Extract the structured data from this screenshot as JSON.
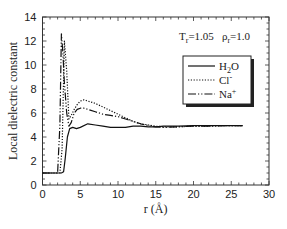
{
  "chart_data": {
    "type": "line",
    "title": "",
    "xlabel": "r (Å)",
    "ylabel": "Local dielectric constant",
    "xlim": [
      0,
      30
    ],
    "ylim": [
      0,
      14
    ],
    "xticks": [
      0,
      5,
      10,
      15,
      20,
      25,
      30
    ],
    "yticks": [
      0,
      2,
      4,
      6,
      8,
      10,
      12,
      14
    ],
    "grid": false,
    "legend_position": "upper right",
    "annotation": "T_r=1.05   ρ_r=1.0",
    "series": [
      {
        "name": "H2O",
        "style": "solid",
        "x": [
          0,
          2.5,
          2.8,
          3.0,
          3.3,
          3.6,
          4.0,
          4.5,
          5.0,
          6.0,
          7.0,
          8.0,
          9.0,
          10.0,
          11.0,
          12.0,
          13.0,
          14.0,
          15.0,
          16.0,
          18.0,
          20.0,
          22.0,
          24.0,
          26.5
        ],
        "y": [
          1.0,
          1.0,
          1.1,
          2.2,
          4.0,
          4.7,
          4.8,
          4.7,
          4.8,
          5.1,
          5.0,
          4.9,
          4.8,
          4.8,
          4.8,
          4.9,
          4.9,
          4.85,
          4.85,
          4.9,
          4.9,
          4.95,
          4.95,
          4.95,
          4.95
        ]
      },
      {
        "name": "Cl-",
        "style": "dotted",
        "x": [
          0,
          2.3,
          2.6,
          2.9,
          3.2,
          3.5,
          3.8,
          4.2,
          4.6,
          5.0,
          5.5,
          6.0,
          7.0,
          8.0,
          9.0,
          10.0,
          11.0,
          12.0,
          13.0,
          14.0,
          15.0,
          16.0,
          18.0,
          20.0,
          22.0,
          24.0,
          26.5
        ],
        "y": [
          1.0,
          1.0,
          3.0,
          12.0,
          9.5,
          5.5,
          5.8,
          6.3,
          6.7,
          7.0,
          7.1,
          7.0,
          6.8,
          6.5,
          6.2,
          5.9,
          5.6,
          5.3,
          5.1,
          5.0,
          4.9,
          4.85,
          4.85,
          4.9,
          4.9,
          4.95,
          4.95
        ]
      },
      {
        "name": "Na+",
        "style": "dashdot",
        "x": [
          0,
          2.0,
          2.3,
          2.5,
          2.7,
          2.9,
          3.2,
          3.5,
          3.8,
          4.2,
          4.6,
          5.0,
          5.5,
          6.0,
          7.0,
          8.0,
          9.0,
          10.0,
          11.0,
          12.0,
          13.0,
          14.0,
          15.0,
          16.0,
          18.0,
          20.0,
          22.0,
          24.0,
          26.5
        ],
        "y": [
          1.0,
          1.0,
          5.0,
          12.6,
          11.0,
          8.5,
          6.0,
          4.9,
          5.2,
          6.0,
          6.3,
          6.4,
          6.4,
          6.3,
          6.1,
          5.9,
          5.8,
          5.7,
          5.5,
          5.3,
          5.1,
          4.95,
          4.85,
          4.8,
          4.85,
          4.9,
          4.9,
          4.95,
          4.95
        ]
      }
    ]
  },
  "legend": {
    "items": [
      {
        "main": "H",
        "sub": "2",
        "rest": "O",
        "style": "solid"
      },
      {
        "main": "Cl",
        "sup": "-",
        "style": "dotted"
      },
      {
        "main": "Na",
        "sup": "+",
        "style": "dashdot"
      }
    ]
  },
  "annotation": {
    "t_main": "T",
    "t_sub": "r",
    "t_val": "=1.05",
    "rho_main": "ρ",
    "rho_sub": "r",
    "rho_val": "=1.0"
  },
  "axes": {
    "xlabel": "r (Å)",
    "ylabel": "Local dielectric constant"
  },
  "colors": {
    "line": "#111111",
    "frame": "#333333",
    "background": "#ffffff"
  }
}
